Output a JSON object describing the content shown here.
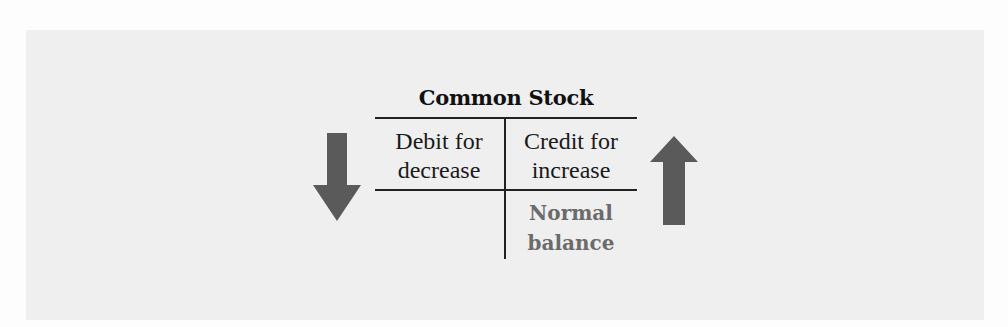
{
  "diagram": {
    "account_name": "Common Stock",
    "debit_side": {
      "line1": "Debit for",
      "line2": "decrease",
      "arrow": "arrow-down-icon"
    },
    "credit_side": {
      "line1": "Credit for",
      "line2": "increase",
      "arrow": "arrow-up-icon"
    },
    "normal_balance": {
      "line1": "Normal",
      "line2": "balance",
      "side": "credit"
    },
    "colors": {
      "panel_background": "#efefef",
      "arrow_fill": "#5a5a5a",
      "rule_lines": "#222222",
      "normal_balance_text": "#6b6b6b"
    }
  }
}
